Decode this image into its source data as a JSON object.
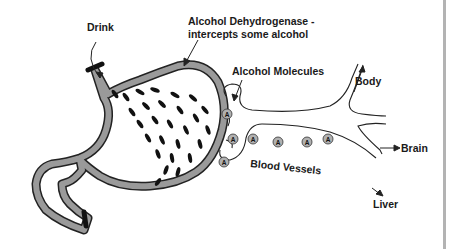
{
  "labels": {
    "drink": "Drink",
    "enzyme_line1": "Alcohol Dehydrogenase -",
    "enzyme_line2": "intercepts some alcohol",
    "molecules": "Alcohol Molecules",
    "blood_vessels": "Blood Vessels",
    "body": "Body",
    "brain": "Brain",
    "liver": "Liver"
  },
  "molecule_symbol": "A",
  "molecule_count": 8,
  "colors": {
    "stomach_wall": "#9a9a9a",
    "outline": "#222222",
    "molecule_fill": "#b0b0b0",
    "droplet": "#111111",
    "border": "#b3b3b3"
  }
}
